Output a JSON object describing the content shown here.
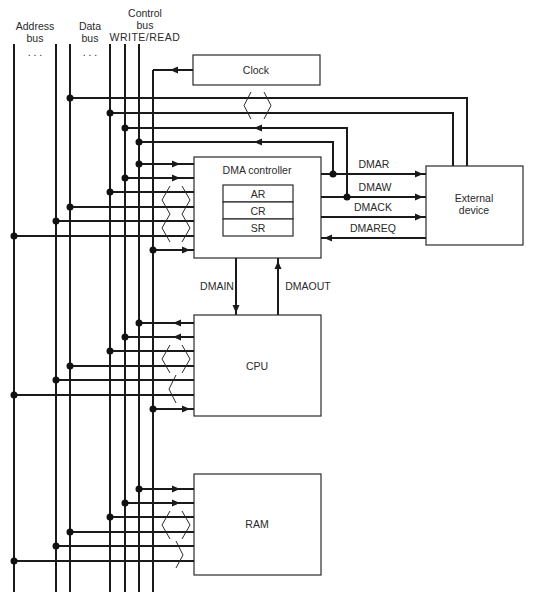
{
  "buses": {
    "address": {
      "line1": "Address",
      "line2": "bus",
      "ellipsis": ". . ."
    },
    "data": {
      "line1": "Data",
      "line2": "bus",
      "ellipsis": ". . ."
    },
    "control": {
      "line1": "Control",
      "line2": "bus",
      "line3": "WRITE/READ"
    }
  },
  "blocks": {
    "clock": "Clock",
    "dma_controller": {
      "title": "DMA controller",
      "registers": [
        "AR",
        "CR",
        "SR"
      ]
    },
    "external_device": {
      "line1": "External",
      "line2": "device"
    },
    "cpu": "CPU",
    "ram": "RAM"
  },
  "signals": {
    "dmar": "DMAR",
    "dmaw": "DMAW",
    "dmack": "DMACK",
    "dmareq": "DMAREQ",
    "dmain": "DMAIN",
    "dmaout": "DMAOUT"
  },
  "colors": {
    "line": "#1a1a1a",
    "text": "#2a2a2a",
    "background": "#ffffff"
  }
}
